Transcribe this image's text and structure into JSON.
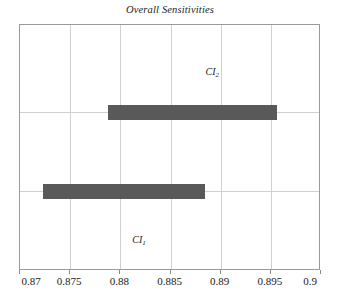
{
  "chart_data": {
    "type": "bar",
    "orientation": "horizontal",
    "title": "Overall Sensitivities",
    "xlabel": "",
    "ylabel": "",
    "xlim": [
      0.87,
      0.9
    ],
    "ylim": [
      0,
      1
    ],
    "grid": true,
    "legend": false,
    "xticks": [
      "0.87",
      "0.875",
      "0.88",
      "0.885",
      "0.89",
      "0.895",
      "0.9"
    ],
    "xtick_values": [
      0.87,
      0.875,
      0.88,
      0.885,
      0.89,
      0.895,
      0.9
    ],
    "yticks": [],
    "categories": [
      "CI_1",
      "CI_2"
    ],
    "intervals": [
      {
        "name": "CI_1",
        "label_main": "CI",
        "label_sub": "1",
        "low": 0.8723,
        "high": 0.8884,
        "y_center": 0.325,
        "color": "#595959"
      },
      {
        "name": "CI_2",
        "label_main": "CI",
        "label_sub": "2",
        "low": 0.8788,
        "high": 0.8956,
        "y_center": 0.646,
        "color": "#595959"
      }
    ],
    "annotations": [
      {
        "text": "CI_2",
        "x": 0.8885,
        "y": 0.805
      },
      {
        "text": "CI_1",
        "x": 0.8812,
        "y": 0.122
      }
    ]
  },
  "colors": {
    "bar": "#595959",
    "grid": "#d0d0d0",
    "frame": "#9a9a9a",
    "background": "#ffffff",
    "text": "#1a1a1a"
  },
  "labels": {
    "ci1_main": "CI",
    "ci1_sub": "1",
    "ci2_main": "CI",
    "ci2_sub": "2"
  }
}
